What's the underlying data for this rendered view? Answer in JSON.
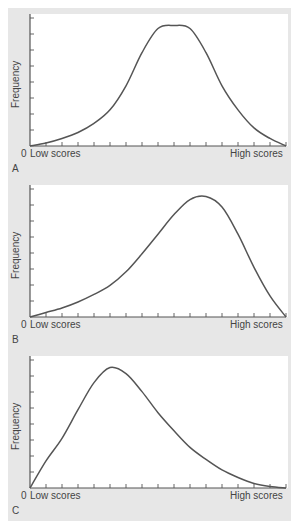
{
  "figure": {
    "panels": [
      {
        "id": "A",
        "label": "A",
        "ylabel": "Frequency",
        "origin_label": "0",
        "x_low_label": "Low scores",
        "x_high_label": "High scores",
        "shape": "symmetric (normal)"
      },
      {
        "id": "B",
        "label": "B",
        "ylabel": "Frequency",
        "origin_label": "0",
        "x_low_label": "Low scores",
        "x_high_label": "High scores",
        "shape": "negatively skewed"
      },
      {
        "id": "C",
        "label": "C",
        "ylabel": "Frequency",
        "origin_label": "0",
        "x_low_label": "Low scores",
        "x_high_label": "High scores",
        "shape": "positively skewed"
      }
    ]
  },
  "chart_data": [
    {
      "type": "line",
      "title": "A",
      "xlabel": "Low scores → High scores",
      "ylabel": "Frequency",
      "x": [
        0,
        1,
        2,
        3,
        4,
        5,
        6,
        7,
        8,
        9,
        10,
        11,
        12,
        13,
        14,
        15,
        16
      ],
      "values": [
        0,
        2,
        5,
        9,
        15,
        24,
        40,
        62,
        78,
        80,
        78,
        62,
        40,
        24,
        12,
        5,
        0
      ],
      "ylim": [
        0,
        85
      ],
      "x_ticks": 16,
      "y_ticks": 8,
      "grid": false,
      "legend": null
    },
    {
      "type": "line",
      "title": "B",
      "xlabel": "Low scores → High scores",
      "ylabel": "Frequency",
      "x": [
        0,
        1,
        2,
        3,
        4,
        5,
        6,
        7,
        8,
        9,
        10,
        11,
        12,
        13,
        14,
        15,
        16
      ],
      "values": [
        0,
        3,
        6,
        10,
        15,
        21,
        30,
        42,
        55,
        68,
        78,
        80,
        73,
        55,
        33,
        14,
        0
      ],
      "ylim": [
        0,
        85
      ],
      "x_ticks": 16,
      "y_ticks": 8,
      "grid": false,
      "legend": null
    },
    {
      "type": "line",
      "title": "C",
      "xlabel": "Low scores → High scores",
      "ylabel": "Frequency",
      "x": [
        0,
        1,
        2,
        3,
        4,
        5,
        6,
        7,
        8,
        9,
        10,
        11,
        12,
        13,
        14,
        15,
        16
      ],
      "values": [
        0,
        18,
        33,
        52,
        70,
        80,
        76,
        64,
        50,
        38,
        27,
        19,
        12,
        7,
        3,
        1,
        0
      ],
      "ylim": [
        0,
        85
      ],
      "x_ticks": 16,
      "y_ticks": 8,
      "grid": false,
      "legend": null
    }
  ],
  "colors": {
    "background": "#e7e7e7",
    "plot_area": "#ffffff",
    "axis": "#555555",
    "curve": "#555555",
    "text": "#444444"
  }
}
